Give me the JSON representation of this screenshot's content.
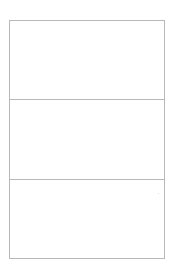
{
  "layout": {
    "panels": [
      {
        "label": ""
      },
      {
        "label": ""
      },
      {
        "label": ""
      }
    ]
  },
  "colors": {
    "border": "#b8b8b8",
    "background": "#ffffff"
  }
}
